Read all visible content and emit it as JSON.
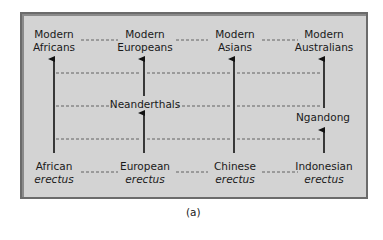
{
  "figure": {
    "caption": "(a)",
    "background_color": "#d3d3d3",
    "border_color": "#6b6b6b",
    "top_row": [
      {
        "line1": "Modern",
        "line2": "Africans"
      },
      {
        "line1": "Modern",
        "line2": "Europeans"
      },
      {
        "line1": "Modern",
        "line2": "Asians"
      },
      {
        "line1": "Modern",
        "line2": "Australians"
      }
    ],
    "bottom_row": [
      {
        "line1": "African",
        "line2": "erectus"
      },
      {
        "line1": "European",
        "line2": "erectus"
      },
      {
        "line1": "Chinese",
        "line2": "erectus"
      },
      {
        "line1": "Indonesian",
        "line2": "erectus"
      }
    ],
    "intermediates": {
      "europe": "Neanderthals",
      "australia": "Ngandong"
    }
  }
}
